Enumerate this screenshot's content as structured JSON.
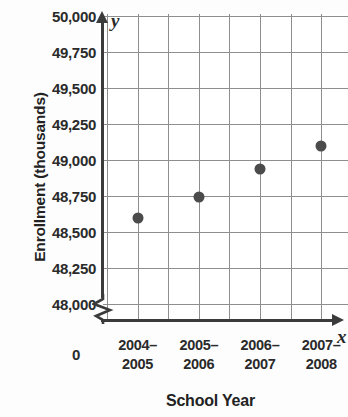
{
  "chart_data": {
    "type": "scatter",
    "title": "",
    "xlabel": "School Year",
    "ylabel": "Enrollment (thousands)",
    "x_axis_letter": "x",
    "y_axis_letter": "y",
    "origin_label": "0",
    "categories": [
      "2004–2005",
      "2005–2006",
      "2006–2007",
      "2007–2008"
    ],
    "category_lines": [
      [
        "2004–",
        "2005"
      ],
      [
        "2005–",
        "2006"
      ],
      [
        "2006–",
        "2007"
      ],
      [
        "2007–",
        "2008"
      ]
    ],
    "values": [
      48600,
      48740,
      48940,
      49100
    ],
    "ylim": [
      48000,
      50000
    ],
    "y_ticks": [
      50000,
      49750,
      49500,
      49250,
      49000,
      48750,
      48500,
      48250,
      48000
    ],
    "y_tick_labels": [
      "50,000",
      "49,750",
      "49,500",
      "49,250",
      "49,000",
      "48,750",
      "48,500",
      "48,250",
      "48,000"
    ],
    "grid": true,
    "legend": "none",
    "axis_break": true,
    "axis_break_note": "y-axis broken below 48,000",
    "colors": {
      "point": "#4b4b4b",
      "gridline": "#8e8e8e",
      "axis": "#3b3b3b",
      "text": "#2a2a2a",
      "background": "#ffffff"
    }
  }
}
